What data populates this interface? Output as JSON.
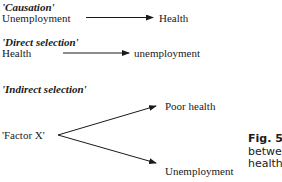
{
  "diagram": {
    "causation": {
      "heading": "'Causation'",
      "from": "Unemployment",
      "to": "Health"
    },
    "direct_selection": {
      "heading": "'Direct selection'",
      "from": "Health",
      "to": "unemployment"
    },
    "indirect_selection": {
      "heading": "'Indirect selection'",
      "source": "'Factor X'",
      "target_top": "Poor health",
      "target_bottom": "Unemployment"
    },
    "caption": {
      "label": "Fig. 5.3",
      "line2": "between",
      "line3": "health."
    }
  },
  "colors": {
    "ink": "#1a1a1a",
    "background": "#ffffff"
  }
}
